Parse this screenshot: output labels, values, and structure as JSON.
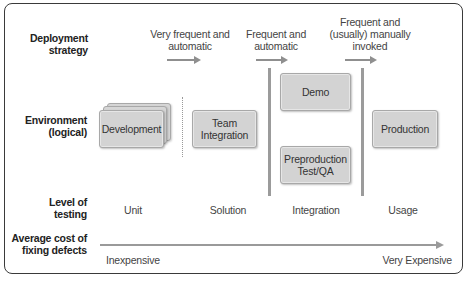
{
  "row_labels": {
    "deployment": [
      "Deployment",
      "strategy"
    ],
    "environment": [
      "Environment",
      "(logical)"
    ],
    "testing": [
      "Level of",
      "testing"
    ],
    "cost": [
      "Average cost of",
      "fixing defects"
    ]
  },
  "deployment_strategies": [
    {
      "lines": [
        "Very frequent and",
        "automatic"
      ]
    },
    {
      "lines": [
        "Frequent and",
        "automatic"
      ]
    },
    {
      "lines": [
        "Frequent and",
        "(usually) manually",
        "invoked"
      ]
    }
  ],
  "environments": {
    "development": "Development",
    "team_integration": [
      "Team",
      "Integration"
    ],
    "demo": "Demo",
    "preproduction": [
      "Preproduction",
      "Test/QA"
    ],
    "production": "Production"
  },
  "testing_levels": [
    "Unit",
    "Solution",
    "Integration",
    "Usage"
  ],
  "cost_scale": {
    "low": "Inexpensive",
    "high": "Very Expensive"
  },
  "colors": {
    "box_fill": "#d3d3d3",
    "box_border": "#a8a8a8",
    "arrow": "#8f8f8f",
    "frame": "#3a3a3a"
  }
}
